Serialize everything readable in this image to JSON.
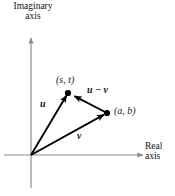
{
  "figure": {
    "kind": "complex-plane-vector-diagram",
    "width": 175,
    "height": 196,
    "background_color": "#ffffff",
    "ink_color": "#000000",
    "axis_color": "#8c8c8c"
  },
  "axes": {
    "imaginary": {
      "line1": "Imaginary",
      "line2": "axis"
    },
    "real": {
      "line1": "Real",
      "line2": "axis"
    }
  },
  "points": [
    {
      "id": "st",
      "label": "(s, t)",
      "x": 68,
      "y": 93
    },
    {
      "id": "ab",
      "label": "(a, b)",
      "x": 107,
      "y": 113
    }
  ],
  "vectors": [
    {
      "id": "u",
      "label": "u",
      "from": [
        31,
        155
      ],
      "to": [
        68,
        93
      ]
    },
    {
      "id": "v",
      "label": "v",
      "from": [
        31,
        155
      ],
      "to": [
        107,
        113
      ]
    },
    {
      "id": "uv",
      "label": "u − v",
      "from": [
        107,
        113
      ],
      "to": [
        68,
        93
      ]
    }
  ],
  "origin": {
    "x": 31,
    "y": 155
  }
}
